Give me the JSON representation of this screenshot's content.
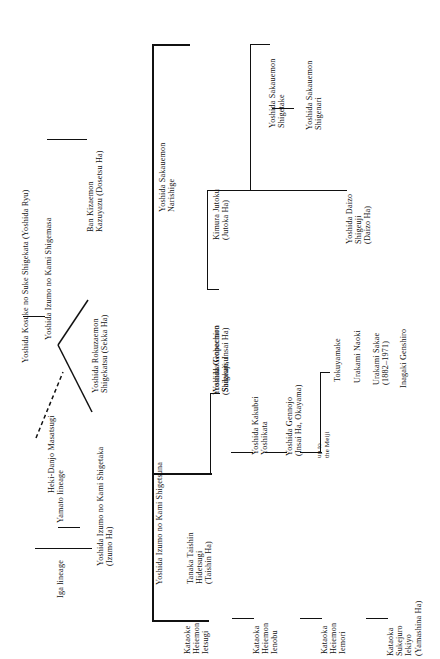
{
  "document": {
    "type": "genealogy-chart",
    "orientation": "rotated-90-counterclockwise",
    "title": "Heki-Danjo Masatsugi lineage chart"
  },
  "nodes": {
    "heki_danjo": "Heki-Danjo Masatsugi",
    "iga_lineage": "Iga lineage",
    "yamato_lineage": "Yamato lineage",
    "kosuke": "Yoshida Kosuke no Suke Shigekata (Yoshida Ryu)",
    "shigemasa": "Yoshida Izumo no Kami Shigemasa",
    "ban_kizaemon": "Ban Kizaemon\nKazuyazu (Dosetsu Ha)",
    "rokuzaemon": "Yoshida Rokuzaemon\nShigekatsu (Sekka Ha)",
    "shigetaka": "Yoshida Izumo no Kami Shigetaka\n(Izumo Ha)",
    "shigetsuna": "Yoshida Izumo no Kami Shigetsuna",
    "narishige": "Yoshida Sakauemon\nNarishige",
    "genpachiro": "Yoshida Genpachiro\n(Shigeuji, Insai Ha)",
    "kimura_jutoku": "Kimura Jutoku\n(Jutoka Ha)",
    "shigetake": "Yoshida Sakauemon\nShigetake",
    "shigenari": "Yoshida Sakauemon\nShigenari",
    "daizo": "Yoshida Daizo\nShigeuji\n(Daizo Ha)",
    "tanaka_taishin": "Tanaka Taishin\nHidetsugi\n(Taishin Ha)",
    "goheemon": "Yoshida Goheemon\nSadakatsu",
    "kakubei": "Yoshida Kakubei\nYoshikata",
    "gennojo": "Yoshida Gennojo\n(Insai Ha, Okayama)",
    "up_to_meiji": "up to\nthe Meiji",
    "tokuyamake": "Tokuyamake",
    "urakami_naoki": "Urakami Naoki",
    "urakami_sakae": "Urakami Sakae\n(1882–1971)",
    "inagaki_genshiro": "Inagaki Genshiro",
    "kataoke_ietsugi": "Kataoke\nHeiemon\nIetsugi",
    "kataoka_ienobu": "Kataoka\nHeiemon\nIenobu",
    "kataoka_iemori": "Kataoka\nHeiemon\nIemori",
    "kataoka_ieiyo": "Kataoka\nSukejuro\nIekiyo\n(Yamashina Ha)"
  },
  "style": {
    "ink": "#111111",
    "paper": "#ffffff"
  }
}
